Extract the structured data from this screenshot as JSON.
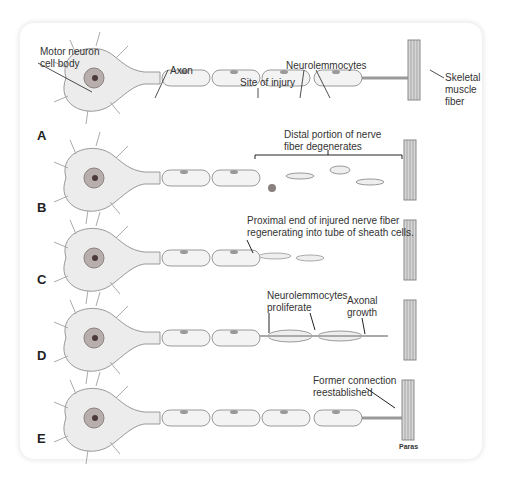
{
  "figure": {
    "signature": "Paras",
    "stages": [
      {
        "letter": "A",
        "labels": {
          "cell_body": "Motor neuron\ncell body",
          "axon": "Axon",
          "injury": "Site of injury",
          "neurolemmocytes": "Neurolemmocytes",
          "muscle": "Skeletal\nmuscle\nfiber"
        }
      },
      {
        "letter": "B",
        "labels": {
          "distal": "Distal portion of nerve\nfiber degenerates"
        }
      },
      {
        "letter": "C",
        "labels": {
          "proximal": "Proximal end of injured nerve fiber\nregenerating into tube of sheath cells."
        }
      },
      {
        "letter": "D",
        "labels": {
          "proliferate": "Neurolemmocytes\nproliferate",
          "growth": "Axonal\ngrowth"
        }
      },
      {
        "letter": "E",
        "labels": {
          "connection": "Former connection\nreestablished"
        }
      }
    ]
  },
  "colors": {
    "cell": "#ececec",
    "outline": "#9a9a9a",
    "nucleus": "#7a6a6a",
    "muscle": "#8a8a8a",
    "text": "#333333"
  }
}
